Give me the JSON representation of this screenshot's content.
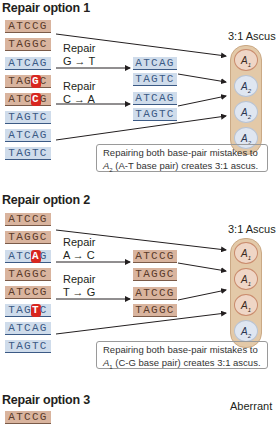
{
  "panels": [
    {
      "title": "Repair option 1",
      "strands": [
        {
          "seq": "ATCCG",
          "color": "tan"
        },
        {
          "seq": "TAGGC",
          "color": "tan"
        },
        {
          "seq": "ATCAG",
          "color": "blue"
        },
        {
          "seq": "TAGGC",
          "color": "tan",
          "mismatch_index": 3,
          "mismatch": "G"
        },
        {
          "seq": "ATCCG",
          "color": "tan",
          "mismatch_index": 3,
          "mismatch": "C"
        },
        {
          "seq": "TAGTC",
          "color": "blue"
        },
        {
          "seq": "ATCAG",
          "color": "blue"
        },
        {
          "seq": "TAGTC",
          "color": "blue"
        }
      ],
      "repairs": [
        {
          "label": "Repair",
          "change": "G → T"
        },
        {
          "label": "Repair",
          "change": "C → A"
        }
      ],
      "repaired_strands": [
        {
          "seq": "ATCAG",
          "color": "blue"
        },
        {
          "seq": "TAGTC",
          "color": "blue",
          "highlight_index": 3
        },
        {
          "seq": "ATCAG",
          "color": "blue",
          "highlight_index": 3
        },
        {
          "seq": "TAGTC",
          "color": "blue"
        }
      ],
      "ascus_label": "3:1 Ascus",
      "spores": [
        {
          "allele": "A",
          "sub": "1",
          "type": "a1"
        },
        {
          "allele": "A",
          "sub": "2",
          "type": "a2"
        },
        {
          "allele": "A",
          "sub": "2",
          "type": "a2"
        },
        {
          "allele": "A",
          "sub": "2",
          "type": "a2"
        }
      ],
      "note_line1": "Repairing both base-pair mistakes to",
      "note_allele": "A",
      "note_sub": "2",
      "note_line2": " (A-T base pair) creates 3:1 ascus."
    },
    {
      "title": "Repair option 2",
      "strands": [
        {
          "seq": "ATCCG",
          "color": "tan"
        },
        {
          "seq": "TAGGC",
          "color": "tan"
        },
        {
          "seq": "ATCAG",
          "color": "blue",
          "mismatch_index": 3,
          "mismatch": "A"
        },
        {
          "seq": "TAGGC",
          "color": "tan"
        },
        {
          "seq": "ATCCG",
          "color": "tan"
        },
        {
          "seq": "TAGTC",
          "color": "blue",
          "mismatch_index": 3,
          "mismatch": "T"
        },
        {
          "seq": "ATCAG",
          "color": "blue"
        },
        {
          "seq": "TAGTC",
          "color": "blue"
        }
      ],
      "repairs": [
        {
          "label": "Repair",
          "change": "A → C"
        },
        {
          "label": "Repair",
          "change": "T → G"
        }
      ],
      "repaired_strands": [
        {
          "seq": "ATCCG",
          "color": "tan",
          "highlight_index": 3
        },
        {
          "seq": "TAGGC",
          "color": "tan"
        },
        {
          "seq": "ATCCG",
          "color": "tan"
        },
        {
          "seq": "TAGGC",
          "color": "tan",
          "highlight_index": 3
        }
      ],
      "ascus_label": "3:1 Ascus",
      "spores": [
        {
          "allele": "A",
          "sub": "1",
          "type": "a1"
        },
        {
          "allele": "A",
          "sub": "1",
          "type": "a1"
        },
        {
          "allele": "A",
          "sub": "1",
          "type": "a1"
        },
        {
          "allele": "A",
          "sub": "2",
          "type": "a2"
        }
      ],
      "note_line1": "Repairing both base-pair mistakes to",
      "note_allele": "A",
      "note_sub": "1",
      "note_line2": " (C-G base pair) creates 3:1 ascus."
    },
    {
      "title": "Repair option 3",
      "strands": [
        {
          "seq": "ATCCG",
          "color": "tan"
        }
      ],
      "ascus_label": "Aberrant"
    }
  ]
}
